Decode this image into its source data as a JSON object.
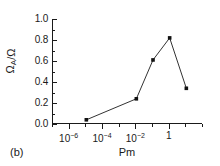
{
  "panel": {
    "label": "(b)"
  },
  "chart_data": {
    "type": "line",
    "title": "",
    "xlabel": "Pm",
    "ylabel": "Ω_A/Ω",
    "ylabel_parts": {
      "main": "Ω",
      "subscript": "A",
      "divider": "/",
      "denominator": "Ω"
    },
    "xscale": "log",
    "yscale": "linear",
    "xlim": [
      1e-07,
      100
    ],
    "ylim": [
      0.0,
      1.0
    ],
    "grid": false,
    "legend": null,
    "marker": "square",
    "line_color": "#333333",
    "marker_color": "#111111",
    "x": [
      1e-05,
      0.01,
      0.1,
      1,
      10
    ],
    "y": [
      0.04,
      0.24,
      0.61,
      0.82,
      0.34
    ],
    "points": [
      {
        "x": 1e-05,
        "y": 0.04
      },
      {
        "x": 0.01,
        "y": 0.24
      },
      {
        "x": 0.1,
        "y": 0.61
      },
      {
        "x": 1,
        "y": 0.82
      },
      {
        "x": 10,
        "y": 0.34
      }
    ],
    "xticks": [
      {
        "value": 1e-06,
        "label_base": "10",
        "label_exp": "-6"
      },
      {
        "value": 0.0001,
        "label_base": "10",
        "label_exp": "-4"
      },
      {
        "value": 0.01,
        "label_base": "10",
        "label_exp": "-2"
      },
      {
        "value": 1,
        "label_base": "1",
        "label_exp": ""
      }
    ],
    "yticks": [
      {
        "value": 1.0,
        "label": "1.0"
      },
      {
        "value": 0.8,
        "label": "0.8"
      },
      {
        "value": 0.6,
        "label": "0.6"
      },
      {
        "value": 0.4,
        "label": "0.4"
      },
      {
        "value": 0.2,
        "label": "0.2"
      },
      {
        "value": 0.0,
        "label": "0.0"
      }
    ],
    "yminor": [
      0.9,
      0.7,
      0.5,
      0.3,
      0.1
    ]
  }
}
